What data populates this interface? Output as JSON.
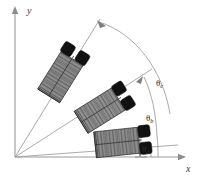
{
  "figure": {
    "background_color": "#ffffff",
    "width": 201,
    "height": 179
  },
  "axes": {
    "origin": {
      "x": 15,
      "y": 157
    },
    "x_axis": {
      "label": "x",
      "label_x": 186,
      "label_y": 172,
      "end_x": 183,
      "end_y": 157
    },
    "y_axis": {
      "label": "y",
      "label_x": 27,
      "label_y": 14,
      "end_x": 15,
      "end_y": 9
    },
    "line_color": "#9a9a9a"
  },
  "angles": [
    {
      "id": "theta-a",
      "symbol": "θ",
      "subscript": "a",
      "label_x": 142,
      "label_y": 152,
      "ray_end_x": 178,
      "ray_end_y": 145,
      "arc_radius": 140,
      "degrees": 6
    },
    {
      "id": "theta-b",
      "symbol": "θ",
      "subscript": "b",
      "label_x": 146,
      "label_y": 121,
      "ray_end_x": 142,
      "ray_end_y": 78,
      "arc_radius": 152,
      "degrees": 32
    },
    {
      "id": "theta-c",
      "symbol": "θ",
      "subscript": "c",
      "label_x": 156,
      "label_y": 86,
      "ray_end_x": 96,
      "ray_end_y": 22,
      "arc_radius": 165,
      "degrees": 58
    }
  ],
  "vehicles": [
    {
      "id": "vehicle-upper",
      "name": "vehicle-position-c",
      "center_x": 63,
      "center_y": 73,
      "rotation_deg": -58,
      "body_color": "#8c8c8c",
      "wheel_color": "#111111"
    },
    {
      "id": "vehicle-middle",
      "name": "vehicle-position-b",
      "center_x": 104,
      "center_y": 108,
      "rotation_deg": -32,
      "body_color": "#8c8c8c",
      "wheel_color": "#111111"
    },
    {
      "id": "vehicle-lower",
      "name": "vehicle-position-a",
      "center_x": 122,
      "center_y": 142,
      "rotation_deg": -6,
      "body_color": "#8c8c8c",
      "wheel_color": "#111111"
    }
  ],
  "colors": {
    "line": "#9a9a9a",
    "body": "#8c8c8c",
    "wheel": "#111111",
    "text": "#2b2b2b"
  }
}
